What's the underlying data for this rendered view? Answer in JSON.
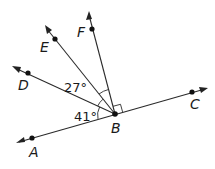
{
  "diagram": {
    "type": "angle-rays",
    "vertex": {
      "label": "B",
      "x": 115,
      "y": 114
    },
    "points": [
      {
        "label": "A",
        "x": 32,
        "y": 138,
        "tip_x": 17,
        "tip_y": 143,
        "label_x": 29,
        "label_y": 157
      },
      {
        "label": "C",
        "x": 192,
        "y": 92,
        "tip_x": 207,
        "tip_y": 88,
        "label_x": 190,
        "label_y": 109
      },
      {
        "label": "D",
        "x": 28,
        "y": 73,
        "tip_x": 13,
        "tip_y": 67,
        "label_x": 18,
        "label_y": 90
      },
      {
        "label": "E",
        "x": 55,
        "y": 39,
        "tip_x": 46,
        "tip_y": 27,
        "label_x": 40,
        "label_y": 52
      },
      {
        "label": "F",
        "x": 92,
        "y": 29,
        "tip_x": 89,
        "tip_y": 13,
        "label_x": 77,
        "label_y": 37
      }
    ],
    "angles": [
      {
        "label": "27°",
        "between": "DBE"
      },
      {
        "label": "41°",
        "between": "ABD"
      }
    ],
    "right_angle": {
      "between": "FBC"
    },
    "colors": {
      "stroke": "#2a2a2a",
      "point": "#111111",
      "background": "#ffffff"
    }
  },
  "labels": {
    "A": "A",
    "B": "B",
    "C": "C",
    "D": "D",
    "E": "E",
    "F": "F",
    "angle_27": "27°",
    "angle_41": "41°"
  }
}
